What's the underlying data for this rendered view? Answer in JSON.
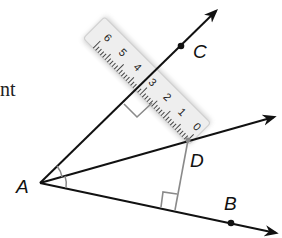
{
  "figure": {
    "partial_text": "nt",
    "points": {
      "A": {
        "label": "A",
        "x": 40,
        "y": 183
      },
      "B": {
        "label": "B",
        "x": 231,
        "y": 223
      },
      "C": {
        "label": "C",
        "x": 181,
        "y": 46
      },
      "D": {
        "label": "D",
        "x": 188,
        "y": 140
      }
    },
    "rays": [
      {
        "name": "ray-AC",
        "from": "A",
        "through": "C"
      },
      {
        "name": "ray-AD",
        "from": "A",
        "through": "D"
      },
      {
        "name": "ray-AB",
        "from": "A",
        "through": "B"
      }
    ],
    "perpendiculars": [
      {
        "from": "D",
        "to_ray": "AC",
        "right_angle_marker": true
      },
      {
        "from": "D",
        "to_ray": "AB",
        "right_angle_marker": true
      }
    ],
    "angle_marks": "two congruent arcs at A (angle bisector AD)",
    "ruler": {
      "numbers": [
        "0",
        "1",
        "2",
        "3",
        "4",
        "5",
        "6"
      ],
      "orientation": "laid along segment from D perpendicular to ray AC, 0 at D"
    },
    "colors": {
      "line": "#111111",
      "perpendicular": "#8a8a8a",
      "ruler_fill": "#eeeeee",
      "ruler_edge": "#c8c8c8"
    }
  }
}
